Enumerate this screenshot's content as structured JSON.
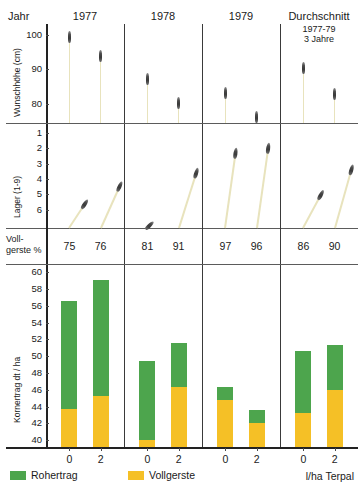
{
  "figure": {
    "row_label": "Jahr",
    "columns": [
      {
        "label": "1977"
      },
      {
        "label": "1978"
      },
      {
        "label": "1979"
      },
      {
        "label": "Durchschnitt",
        "sub1": "1977-79",
        "sub2": "3 Jahre"
      }
    ],
    "x_axis_label": "l/ha Terpal",
    "x_tick_labels": [
      "0",
      "2",
      "0",
      "2",
      "0",
      "2",
      "0",
      "2"
    ]
  },
  "legend": {
    "items": [
      {
        "name": "Rohertrag",
        "color": "#4da54d"
      },
      {
        "name": "Vollgerste",
        "color": "#f5c026"
      }
    ]
  },
  "panel_height": {
    "ylabel": "Wunschhöhe (cm)",
    "ticks": [
      "100",
      "90",
      "80"
    ]
  },
  "panel_lodging": {
    "ylabel": "Lager (1-9)",
    "ticks": [
      "1",
      "2",
      "3",
      "4",
      "5",
      "6"
    ]
  },
  "panel_vollgerste": {
    "label_line1": "Voll-",
    "label_line2": "gerste %",
    "values": [
      "75",
      "76",
      "81",
      "91",
      "97",
      "96",
      "86",
      "90"
    ]
  },
  "panel_yield": {
    "ylabel": "Kornertrag dt / ha",
    "ticks": [
      "60",
      "58",
      "56",
      "54",
      "52",
      "50",
      "48",
      "46",
      "44",
      "42",
      "40"
    ]
  },
  "chart_data": [
    {
      "type": "scatter",
      "title": "Wunschhöhe (cm)",
      "ylabel": "Wunschhöhe (cm)",
      "xlabel": "l/ha Terpal",
      "ylim": [
        75,
        102
      ],
      "yticks": [
        100,
        90,
        80
      ],
      "groups": [
        "1977",
        "1978",
        "1979",
        "Durchschnitt 1977-79"
      ],
      "categories": [
        "0",
        "2",
        "0",
        "2",
        "0",
        "2",
        "0",
        "2"
      ],
      "values": [
        101,
        95.5,
        89,
        82,
        85,
        78,
        92,
        84.5
      ],
      "grid": false
    },
    {
      "type": "scatter",
      "title": "Lager (1-9)",
      "ylabel": "Lager (1-9)",
      "xlabel": "l/ha Terpal",
      "ylim": [
        0.6,
        7.0
      ],
      "yticks": [
        1,
        2,
        3,
        4,
        5,
        6
      ],
      "groups": [
        "1977",
        "1978",
        "1979",
        "Durchschnitt 1977-79"
      ],
      "categories": [
        "0",
        "2",
        "0",
        "2",
        "0",
        "2",
        "0",
        "2"
      ],
      "values": [
        5.0,
        3.9,
        6.6,
        3.1,
        1.9,
        1.6,
        4.4,
        2.9
      ],
      "grid": false
    },
    {
      "type": "table",
      "title": "Vollgerste %",
      "categories": [
        "0",
        "2",
        "0",
        "2",
        "0",
        "2",
        "0",
        "2"
      ],
      "values": [
        75,
        76,
        81,
        91,
        97,
        96,
        86,
        90
      ]
    },
    {
      "type": "bar",
      "title": "Kornertrag dt / ha",
      "ylabel": "Kornertrag dt / ha",
      "xlabel": "l/ha Terpal",
      "ylim": [
        39.2,
        60.5
      ],
      "yticks": [
        40,
        42,
        44,
        46,
        48,
        50,
        52,
        54,
        56,
        58,
        60
      ],
      "groups": [
        "1977",
        "1978",
        "1979",
        "Durchschnitt 1977-79"
      ],
      "categories": [
        "0",
        "2",
        "0",
        "2",
        "0",
        "2",
        "0",
        "2"
      ],
      "stacked": true,
      "series": [
        {
          "name": "Vollgerste",
          "color": "#f5c026",
          "values": [
            43.7,
            45.3,
            40.0,
            46.3,
            44.8,
            42.1,
            43.3,
            46.0
          ]
        },
        {
          "name": "Rohertrag",
          "color": "#4da54d",
          "values": [
            56.5,
            59.0,
            49.4,
            51.6,
            46.3,
            43.6,
            50.6,
            51.3
          ]
        }
      ],
      "note": "Rohertrag values are bar totals; green segment is total minus Vollgerste",
      "grid": false,
      "legend_position": "bottom-left"
    }
  ]
}
